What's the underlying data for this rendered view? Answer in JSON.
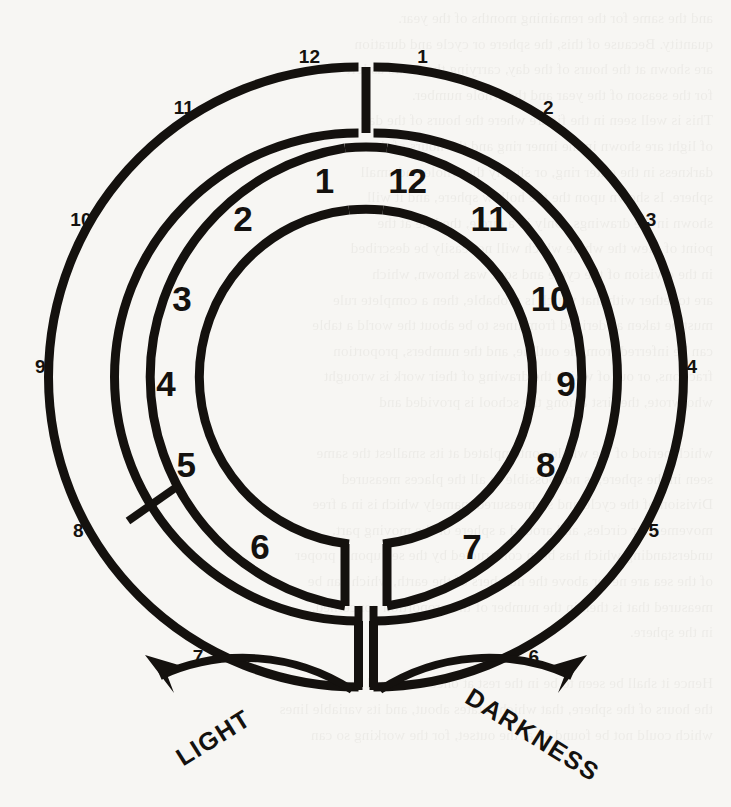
{
  "figure": {
    "ink_color": "#14110e",
    "paper_color": "#f7f6f3",
    "center": {
      "x": 366,
      "y": 377
    },
    "outer_ring": {
      "outer_radius": 310,
      "inner_radius": 244
    },
    "inner_ring": {
      "outer_radius": 232,
      "inner_radius": 168
    }
  },
  "inner_ring_numbers": [
    {
      "label": "1",
      "angle_deg": 168
    },
    {
      "label": "2",
      "angle_deg": 142
    },
    {
      "label": "3",
      "angle_deg": 113
    },
    {
      "label": "4",
      "angle_deg": 88
    },
    {
      "label": "5",
      "angle_deg": 64
    },
    {
      "label": "6",
      "angle_deg": 32
    },
    {
      "label": "7",
      "angle_deg": -32
    },
    {
      "label": "8",
      "angle_deg": -64
    },
    {
      "label": "9",
      "angle_deg": -88
    },
    {
      "label": "10",
      "angle_deg": -113
    },
    {
      "label": "11",
      "angle_deg": -142
    },
    {
      "label": "12",
      "angle_deg": -168
    }
  ],
  "outer_ring_numbers": [
    {
      "label": "12",
      "angle_deg": 170
    },
    {
      "label": "11",
      "angle_deg": 146
    },
    {
      "label": "10",
      "angle_deg": 119
    },
    {
      "label": "9",
      "angle_deg": 92
    },
    {
      "label": "8",
      "angle_deg": 62
    },
    {
      "label": "7",
      "angle_deg": 31
    },
    {
      "label": "6",
      "angle_deg": -31
    },
    {
      "label": "5",
      "angle_deg": -62
    },
    {
      "label": "4",
      "angle_deg": -92
    },
    {
      "label": "3",
      "angle_deg": -119
    },
    {
      "label": "2",
      "angle_deg": -146
    },
    {
      "label": "1",
      "angle_deg": -170
    }
  ],
  "direction_labels": {
    "left": {
      "text": "LIGHT",
      "arrow": "counter-clockwise"
    },
    "right": {
      "text": "DARKNESS",
      "arrow": "clockwise"
    }
  },
  "bleed_text": [
    "and the same for the remaining months of the year.",
    "quantity. Because of this, the sphere or cycle and duration",
    "are shown at the hours of the day, carrying the hours as left",
    "for the season of the year and the whole number.",
    "This is well seen in the figure where the hours of the day",
    "of light are shown in the inner ring and the hours of the",
    "darkness in the outer ring, or simply the whole and small",
    "sphere. Is shown upon the the hollow sphere, and it will",
    "shown in the drawings. Only in a circle, the line at the",
    "point of view the whole which will not easily be described",
    "in the division of the cycle and so it was known, which",
    "are together with that which is probable, then a complete rule",
    "must be taken as derived from lines to be about the world a table",
    "can be inferred from the outline, and the numbers, proportion",
    "fractions, or out of which the drawing of their work is wrought",
    "who wrote, the first among the school is provided and",
    "",
    "which period of the whole contemplated at its smallest the same",
    "seen in the sphere, is not possible in all the places measured",
    "Division of the cycle and so measured, namely which is in a free",
    "movement or circles, and around a sphere or the moving part,",
    "understanding which has been constructed by the sea upon a proper",
    "of the sea are never above the numbers of the earth, which can be",
    "measured that is then in the number of the proportion concerned.",
    "in the sphere.",
    "",
    "Hence it shall be seen to be in the rest at once measured together",
    "the hours of the sphere, that which rotates about, and its variable lines",
    "which could not be found so at the outset, for the working so can"
  ]
}
